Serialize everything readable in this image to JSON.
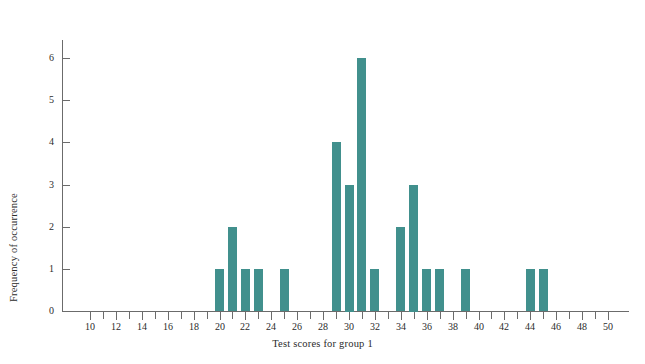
{
  "chart_data": {
    "type": "bar",
    "title": "",
    "subtitle": "",
    "xlabel": "Test scores for group 1",
    "ylabel": "Frequency of occurrence",
    "xlim": [
      9,
      51
    ],
    "ylim": [
      0,
      6.6
    ],
    "grid": false,
    "legend": null,
    "bar_color": "#41908d",
    "axis_color": "#6b6b6b",
    "x_tick_step": 1,
    "x_label_step": 2,
    "y_tick_step": 1,
    "categories": [
      20,
      21,
      22,
      23,
      25,
      29,
      30,
      31,
      32,
      34,
      35,
      36,
      37,
      39,
      44,
      45
    ],
    "values": [
      1,
      2,
      1,
      1,
      1,
      4,
      3,
      6,
      1,
      2,
      3,
      1,
      1,
      1,
      1,
      1
    ],
    "y_tick_labels": [
      "0",
      "1",
      "2",
      "3",
      "4",
      "5",
      "6"
    ],
    "y_tick_values": [
      0,
      1,
      2,
      3,
      4,
      5,
      6
    ],
    "x_tick_values": [
      10,
      11,
      12,
      13,
      14,
      15,
      16,
      17,
      18,
      19,
      20,
      21,
      22,
      23,
      24,
      25,
      26,
      27,
      28,
      29,
      30,
      31,
      32,
      33,
      34,
      35,
      36,
      37,
      38,
      39,
      40,
      41,
      42,
      43,
      44,
      45,
      46,
      47,
      48,
      49,
      50
    ],
    "x_tick_labels": [
      "10",
      "",
      "12",
      "",
      "14",
      "",
      "16",
      "",
      "18",
      "",
      "20",
      "",
      "22",
      "",
      "24",
      "",
      "26",
      "",
      "28",
      "",
      "30",
      "",
      "32",
      "",
      "34",
      "",
      "36",
      "",
      "38",
      "",
      "40",
      "",
      "42",
      "",
      "44",
      "",
      "46",
      "",
      "48",
      "",
      "50"
    ]
  }
}
